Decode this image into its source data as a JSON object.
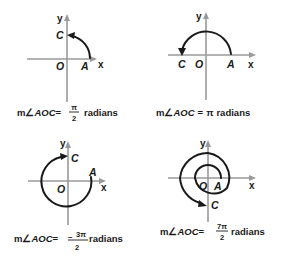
{
  "figure": {
    "panels": [
      {
        "id": "right-angle",
        "axis_labels": {
          "x": "x",
          "y": "y"
        },
        "points": {
          "origin": "O",
          "initial": "A",
          "terminal": "C"
        },
        "caption": {
          "prefix": "m",
          "angle_symbol": "∠",
          "angle_name": "AOC",
          "equals": "=",
          "numerator": "π",
          "denominator": "2",
          "unit": "radians"
        }
      },
      {
        "id": "straight-angle",
        "axis_labels": {
          "x": "x",
          "y": "y"
        },
        "points": {
          "origin": "O",
          "initial": "A",
          "terminal": "C"
        },
        "caption": {
          "prefix": "m",
          "angle_symbol": "∠",
          "angle_name": "AOC",
          "equals": "=",
          "value": "π",
          "unit": "radians"
        }
      },
      {
        "id": "negative-three-quarter",
        "axis_labels": {
          "x": "x",
          "y": "y"
        },
        "points": {
          "origin": "O",
          "initial": "A",
          "terminal": "C"
        },
        "caption": {
          "prefix": "m",
          "angle_symbol": "∠",
          "angle_name": "AOC",
          "equals": "=",
          "sign": "−",
          "numerator": "3π",
          "denominator": "2",
          "unit": "radians"
        }
      },
      {
        "id": "seven-halves-pi",
        "axis_labels": {
          "x": "x",
          "y": "y"
        },
        "points": {
          "origin": "O",
          "initial": "A",
          "terminal": "C"
        },
        "caption": {
          "prefix": "m",
          "angle_symbol": "∠",
          "angle_name": "AOC",
          "equals": "=",
          "numerator": "7π",
          "denominator": "2",
          "unit": "radians"
        }
      }
    ],
    "colors": {
      "axis": "#9a9a9a",
      "arc": "#1a1a1a",
      "text": "#1a1a1a",
      "background": "#ffffff"
    }
  }
}
